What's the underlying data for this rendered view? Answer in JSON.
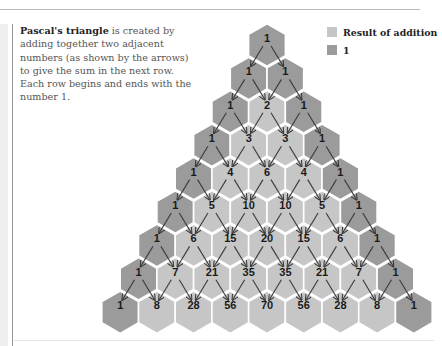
{
  "intro": {
    "bold": "Pascal's triangle",
    "text": " is created by adding together two adjacent numbers (as shown by the arrows) to give the sum in the next row. Each row begins and ends with the number 1."
  },
  "legend": [
    {
      "label": "Result of addition",
      "color": "#c6c6c6"
    },
    {
      "label": "1",
      "color": "#9b9b9b"
    }
  ],
  "colors": {
    "edge": "#9b9b9b",
    "result": "#c6c6c6",
    "arrow": "#3a3a3a",
    "hex_border": "#ffffff"
  },
  "chart_data": {
    "type": "diagram",
    "title": "Pascal's triangle",
    "rows": [
      [
        1
      ],
      [
        1,
        1
      ],
      [
        1,
        2,
        1
      ],
      [
        1,
        3,
        3,
        1
      ],
      [
        1,
        4,
        6,
        4,
        1
      ],
      [
        1,
        5,
        10,
        10,
        5,
        1
      ],
      [
        1,
        6,
        15,
        20,
        15,
        6,
        1
      ],
      [
        1,
        7,
        21,
        35,
        35,
        21,
        7,
        1
      ],
      [
        1,
        8,
        28,
        56,
        70,
        56,
        28,
        8,
        1
      ]
    ]
  }
}
